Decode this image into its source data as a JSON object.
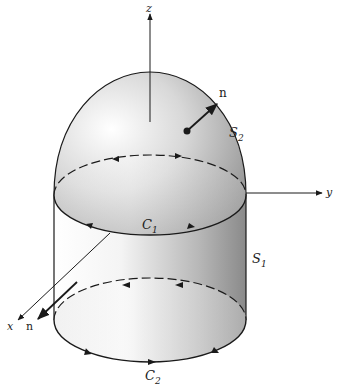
{
  "figure": {
    "axes": {
      "z_label": "z",
      "y_label": "y",
      "x_label": "x"
    },
    "surfaces": {
      "dome_label": "S",
      "dome_sub": "2",
      "cylinder_label": "S",
      "cylinder_sub": "1"
    },
    "curves": {
      "upper_label": "C",
      "upper_sub": "1",
      "lower_label": "C",
      "lower_sub": "2"
    },
    "normals": {
      "dome_normal_label": "n",
      "cylinder_normal_label": "n"
    },
    "colors": {
      "line": "#1a1a1a",
      "shade_light": "#ffffff",
      "shade_dark": "#8a8a8a"
    }
  }
}
